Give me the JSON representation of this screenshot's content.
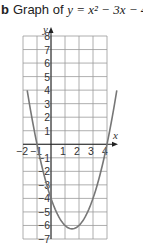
{
  "title": {
    "label": "b",
    "text_prefix": "Graph of ",
    "equation": "y = x² − 3x − 4"
  },
  "chart_data": {
    "type": "line",
    "xlabel": "x",
    "ylabel": "y",
    "xlim": [
      -2,
      4
    ],
    "ylim": [
      -7,
      8
    ],
    "grid": true,
    "x_ticks": [
      -2,
      -1,
      1,
      2,
      3,
      4
    ],
    "y_ticks": [
      8,
      7,
      6,
      5,
      4,
      3,
      2,
      1,
      -1,
      -2,
      -3,
      -4,
      -5,
      -6,
      -7
    ],
    "series": [
      {
        "name": "y = x^2 - 3x - 4",
        "x": [
          -1.7,
          -1,
          0,
          1,
          1.5,
          2,
          3,
          4,
          4.7
        ],
        "y": [
          3.99,
          0,
          -4,
          -6,
          -6.25,
          -6,
          -4,
          0,
          3.99
        ]
      }
    ],
    "line_color": "#777777",
    "grid_color": "#9a9a9a"
  }
}
